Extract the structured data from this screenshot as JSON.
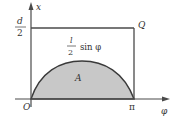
{
  "diagram": {
    "type": "buffon-needle-sample-space",
    "axes": {
      "x_label": "φ",
      "y_label": "x",
      "origin_label": "O",
      "x_tick_label": "π",
      "y_tick_label": {
        "numerator": "d",
        "denominator": "2"
      }
    },
    "region": {
      "rect_corner_label": "Q",
      "curve_label": {
        "numerator": "l",
        "denominator": "2",
        "function": "sin φ"
      },
      "shaded_area_label": "A"
    },
    "colors": {
      "line": "#4a4a4a",
      "fill": "#c8c8c8",
      "background": "#ffffff"
    }
  }
}
